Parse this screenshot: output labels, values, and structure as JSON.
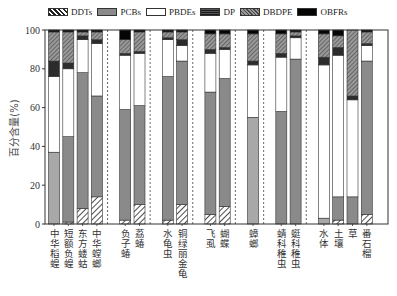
{
  "chart_data": {
    "type": "bar",
    "stacked": true,
    "title": "",
    "xlabel": "",
    "ylabel": "百分含量(%)",
    "ylim": [
      0,
      100
    ],
    "yticks": [
      0,
      20,
      40,
      60,
      80,
      100
    ],
    "legend_position": "top",
    "groups": [
      [
        "中华稻蝗",
        "短额负蝗",
        "东方蝼蛄",
        "中华螳螂"
      ],
      [
        "负子蝽",
        "荔蝽"
      ],
      [
        "水龟虫",
        "铜绿丽金龟"
      ],
      [
        "飞虱",
        "蝴蝶"
      ],
      [
        "蟑螂"
      ],
      [
        "蜻科稚虫",
        "蜓科稚虫"
      ],
      [
        "水体",
        "土壤",
        "草",
        "番石榴"
      ]
    ],
    "categories": [
      "中华稻蝗",
      "短额负蝗",
      "东方蝼蛄",
      "中华螳螂",
      "负子蝽",
      "荔蝽",
      "水龟虫",
      "铜绿丽金龟",
      "飞虱",
      "蝴蝶",
      "蟑螂",
      "蜻科稚虫",
      "蜓科稚虫",
      "水体",
      "土壤",
      "草",
      "番石榴"
    ],
    "series": [
      {
        "name": "DDTs",
        "fill": "ddt",
        "values": [
          0,
          1,
          8,
          14,
          2,
          10,
          2,
          10,
          5,
          9,
          0,
          0,
          0,
          0,
          2,
          0,
          5
        ]
      },
      {
        "name": "PCBs",
        "fill": "pcb",
        "values": [
          37,
          44,
          70,
          52,
          57,
          51,
          74,
          74,
          63,
          66,
          55,
          58,
          85,
          3,
          12,
          14,
          79
        ]
      },
      {
        "name": "PBDEs",
        "fill": "pbde",
        "values": [
          39,
          35,
          17,
          27,
          28,
          27,
          19,
          8,
          20,
          15,
          27,
          28,
          11,
          79,
          73,
          50,
          8
        ]
      },
      {
        "name": "DP",
        "fill": "dp",
        "values": [
          8,
          3,
          2,
          2,
          1,
          1,
          1,
          3,
          2,
          1,
          2,
          2,
          1,
          4,
          4,
          2,
          1
        ]
      },
      {
        "name": "DBDPE",
        "fill": "dbdpe",
        "values": [
          15,
          16,
          2,
          4,
          7,
          10,
          3,
          4,
          8,
          7,
          14,
          10,
          2,
          12,
          6,
          34,
          6
        ]
      },
      {
        "name": "OBFRs",
        "fill": "obfr",
        "values": [
          1,
          1,
          1,
          1,
          5,
          1,
          1,
          1,
          2,
          2,
          2,
          2,
          1,
          2,
          3,
          0,
          1
        ]
      }
    ],
    "pcb_light_bars": [
      "中华稻蝗",
      "蟑螂",
      "水体"
    ]
  },
  "legend": [
    {
      "label": "DDTs",
      "fill": "ddt"
    },
    {
      "label": "PCBs",
      "fill": "pcb"
    },
    {
      "label": "PBDEs",
      "fill": "pbde"
    },
    {
      "label": "DP",
      "fill": "dp"
    },
    {
      "label": "DBDPE",
      "fill": "dbdpe"
    },
    {
      "label": "OBFRs",
      "fill": "obfr"
    }
  ],
  "colors": {
    "pcb": "#8a8a8a",
    "pcb_light": "#a8a8a8",
    "pbde": "#ffffff",
    "dp": "#2a2a2a",
    "obfr": "#050505",
    "axis": "#333333"
  }
}
